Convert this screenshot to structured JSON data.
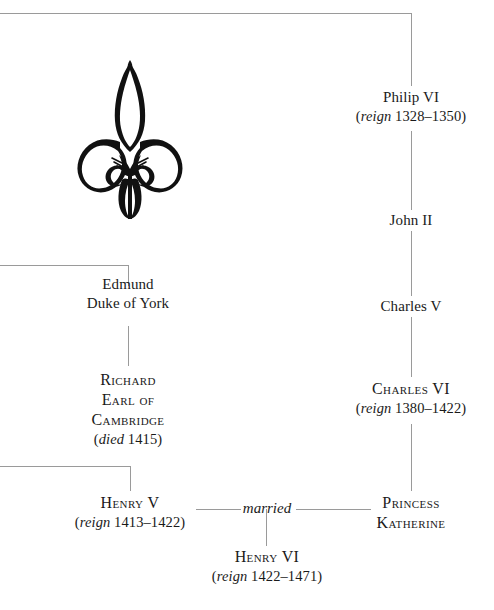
{
  "figure": {
    "kind": "genealogy-family-tree",
    "ornament": "fleur-de-lis",
    "line_color": "#9a9a9a",
    "text_color": "#1a1a1a",
    "background": "#ffffff"
  },
  "nodes": {
    "philip_vi": {
      "name": "Philip VI",
      "detail_label": "reign",
      "detail_value": "1328–1350"
    },
    "john_ii": {
      "name": "John II"
    },
    "charles_v": {
      "name": "Charles V"
    },
    "charles_vi": {
      "name": "Charles VI",
      "detail_label": "reign",
      "detail_value": "1380–1422"
    },
    "princess_katherine_line1": {
      "name": "Princess"
    },
    "princess_katherine_line2": {
      "name": "Katherine"
    },
    "edmund_line1": {
      "name": "Edmund"
    },
    "edmund_line2": {
      "name": "Duke of York"
    },
    "richard_line1": {
      "name": "Richard"
    },
    "richard_line2": {
      "name": "Earl of"
    },
    "richard_line3": {
      "name": "Cambridge"
    },
    "richard_detail": {
      "detail_label": "died",
      "detail_value": "1415"
    },
    "henry_v": {
      "name": "Henry V",
      "detail_label": "reign",
      "detail_value": "1413–1422"
    },
    "henry_vi": {
      "name": "Henry VI",
      "detail_label": "reign",
      "detail_value": "1422–1471"
    }
  },
  "relations": {
    "marriage_label": "married"
  },
  "punctuation": {
    "open_paren": "(",
    "close_paren": ")"
  }
}
